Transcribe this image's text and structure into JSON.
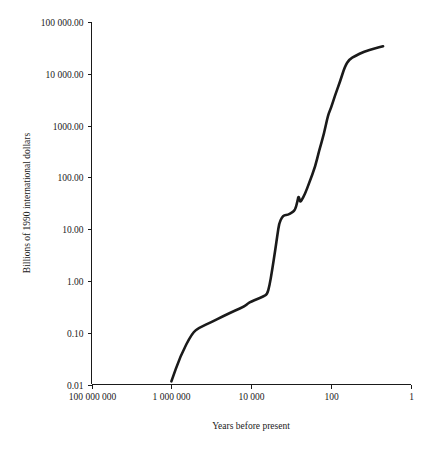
{
  "chart_data": {
    "type": "line",
    "title": "",
    "subtitle": "",
    "xlabel": "Years before present",
    "ylabel": "Billions of 1990 international dollars",
    "xscale": "log-reversed",
    "yscale": "log",
    "grid": false,
    "legend": null,
    "xlim": [
      100000000,
      1
    ],
    "ylim": [
      0.01,
      100000
    ],
    "xticks": [
      {
        "value": 100000000,
        "label": "100 000 000"
      },
      {
        "value": 1000000,
        "label": "1 000 000"
      },
      {
        "value": 10000,
        "label": "10 000"
      },
      {
        "value": 100,
        "label": "100"
      },
      {
        "value": 1,
        "label": "1"
      }
    ],
    "yticks": [
      {
        "value": 0.01,
        "label": "0.01"
      },
      {
        "value": 0.1,
        "label": "0.10"
      },
      {
        "value": 1,
        "label": "1.00"
      },
      {
        "value": 10,
        "label": "10.00"
      },
      {
        "value": 100,
        "label": "100.00"
      },
      {
        "value": 1000,
        "label": "1000.00"
      },
      {
        "value": 10000,
        "label": "10 000.00"
      },
      {
        "value": 100000,
        "label": "100 000.00"
      }
    ],
    "series": [
      {
        "name": "World GDP",
        "color": "#1a1a1a",
        "points": [
          [
            1000000,
            0.0115
          ],
          [
            600000,
            0.035
          ],
          [
            300000,
            0.1
          ],
          [
            200000,
            0.125
          ],
          [
            100000,
            0.16
          ],
          [
            50000,
            0.21
          ],
          [
            25000,
            0.27
          ],
          [
            15000,
            0.32
          ],
          [
            12000,
            0.37
          ],
          [
            10000,
            0.4
          ],
          [
            7000,
            0.45
          ],
          [
            5000,
            0.5
          ],
          [
            4000,
            0.55
          ],
          [
            3500,
            0.8
          ],
          [
            3000,
            1.6
          ],
          [
            2500,
            4.0
          ],
          [
            2200,
            8.0
          ],
          [
            2000,
            13.0
          ],
          [
            1700,
            17.0
          ],
          [
            1500,
            18.5
          ],
          [
            1200,
            19.0
          ],
          [
            1000,
            20.5
          ],
          [
            800,
            23.0
          ],
          [
            700,
            34.0
          ],
          [
            650,
            45.0
          ],
          [
            600,
            33.0
          ],
          [
            550,
            36.0
          ],
          [
            450,
            48.0
          ],
          [
            350,
            80.0
          ],
          [
            250,
            160.0
          ],
          [
            200,
            330.0
          ],
          [
            150,
            700.0
          ],
          [
            120,
            1600.0
          ],
          [
            100,
            2200.0
          ],
          [
            80,
            3800.0
          ],
          [
            60,
            7000.0
          ],
          [
            45,
            14000.0
          ],
          [
            35,
            19000.0
          ],
          [
            25,
            22000.0
          ],
          [
            15,
            27000.0
          ],
          [
            8,
            31000.0
          ],
          [
            5,
            34000.0
          ]
        ]
      }
    ]
  },
  "axes": {
    "y_title": "Billions of 1990 international dollars",
    "x_title": "Years before present"
  }
}
